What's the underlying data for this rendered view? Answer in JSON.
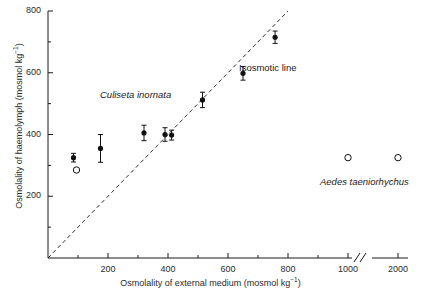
{
  "figure": {
    "background": "#ffffff",
    "ink": "#1a1a1a"
  },
  "axes": {
    "x": {
      "title_main": "Osmolality of external medium (mosmol kg",
      "title_sup": "−1",
      "title_tail": ")",
      "ticks": [
        "200",
        "400",
        "600",
        "800",
        "1000",
        "2000"
      ],
      "tick_values": [
        200,
        400,
        600,
        800,
        1000,
        2000
      ],
      "has_break": true,
      "break_symbol": "//",
      "break_between": [
        1000,
        2000
      ],
      "minor_ticks": [
        100,
        300,
        500,
        700,
        900
      ]
    },
    "y": {
      "title_main": "Osmolality of haemolymph (mosmol kg",
      "title_sup": "−1",
      "title_tail": ")",
      "ticks": [
        "200",
        "400",
        "600",
        "800"
      ],
      "tick_values": [
        200,
        400,
        600,
        800
      ],
      "minor_ticks": [
        100,
        300,
        500,
        700
      ],
      "range": [
        0,
        800
      ]
    }
  },
  "annotations": [
    {
      "name": "isosmotic-line-label",
      "text": "Isosmotic line",
      "x": 239,
      "y": 62,
      "italic": false
    },
    {
      "name": "culiseta-inornata-label",
      "text": "Culiseta inornata",
      "x": 100,
      "y": 89,
      "italic": true
    },
    {
      "name": "aedes-taeniorhychus-label",
      "text": "Aedes taeniorhychus",
      "x": 320,
      "y": 176,
      "italic": true
    }
  ],
  "chart_data": {
    "type": "scatter",
    "title": "",
    "xlabel": "Osmolality of external medium (mosmol kg−1)",
    "ylabel": "Osmolality of haemolymph (mosmol kg−1)",
    "xlim": [
      0,
      2000
    ],
    "ylim": [
      0,
      800
    ],
    "grid": false,
    "legend": "none",
    "series": [
      {
        "name": "Culiseta inornata",
        "marker": "filled-circle",
        "color": "#111111",
        "error_bars": "vertical",
        "points": [
          {
            "x": 85,
            "y": 325,
            "yerr": 14
          },
          {
            "x": 175,
            "y": 355,
            "yerr": 45
          },
          {
            "x": 320,
            "y": 405,
            "yerr": 25
          },
          {
            "x": 390,
            "y": 400,
            "yerr": 22
          },
          {
            "x": 412,
            "y": 398,
            "yerr": 16
          },
          {
            "x": 515,
            "y": 512,
            "yerr": 25
          },
          {
            "x": 650,
            "y": 598,
            "yerr": 22
          },
          {
            "x": 757,
            "y": 715,
            "yerr": 20
          }
        ]
      },
      {
        "name": "Aedes taeniorhychus",
        "marker": "open-circle",
        "color": "#111111",
        "error_bars": "none",
        "points": [
          {
            "x": 95,
            "y": 285
          },
          {
            "x": 1000,
            "y": 325
          },
          {
            "x": 2000,
            "y": 325
          }
        ]
      }
    ],
    "reference_line": {
      "name": "Isosmotic line",
      "style": "dashed",
      "from": {
        "x": 0,
        "y": 0
      },
      "to": {
        "x": 800,
        "y": 800
      }
    }
  }
}
